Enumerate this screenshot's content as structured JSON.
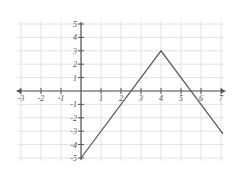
{
  "chart_data": {
    "type": "line",
    "title": "",
    "xlabel": "",
    "ylabel": "",
    "xlim": [
      -3,
      7
    ],
    "ylim": [
      -5,
      5
    ],
    "grid": true,
    "x_ticks": [
      -3,
      -2,
      -1,
      1,
      2,
      3,
      4,
      5,
      6,
      7
    ],
    "y_ticks": [
      5,
      4,
      3,
      2,
      1,
      -1,
      -2,
      -3,
      -4,
      -5
    ],
    "series": [
      {
        "name": "piecewise linear",
        "points": [
          [
            0,
            -5
          ],
          [
            4,
            3
          ],
          [
            7.1,
            -3.2
          ]
        ]
      }
    ]
  },
  "colors": {
    "grid": "#e2e2e2",
    "axis": "#555555",
    "line": "#555555"
  }
}
